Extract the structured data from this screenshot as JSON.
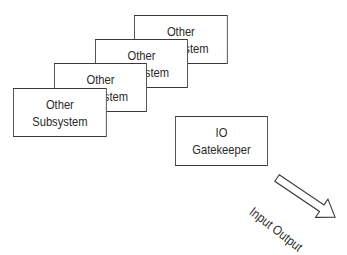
{
  "diagram": {
    "subsystem_boxes": [
      {
        "line1": "Other",
        "line2": "Subsystem"
      },
      {
        "line1": "Other",
        "line2": "Subsystem"
      },
      {
        "line1": "Other",
        "line2": "Subsystem"
      },
      {
        "line1": "Other",
        "line2": "Subsystem"
      }
    ],
    "gatekeeper": {
      "line1": "IO",
      "line2": "Gatekeeper"
    },
    "arrow_label": "Input Output",
    "colors": {
      "stroke": "#3a3a3a",
      "text": "#2a2a2a",
      "background": "#ffffff"
    }
  }
}
